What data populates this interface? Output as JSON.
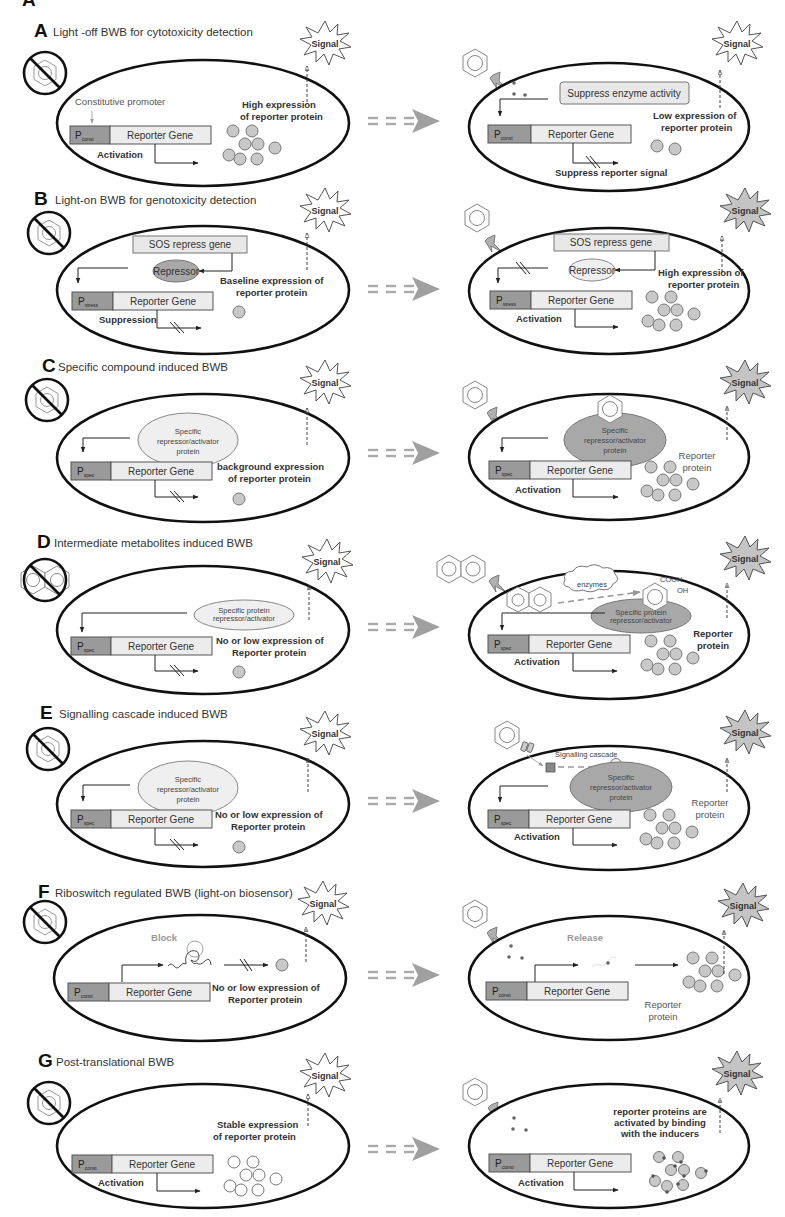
{
  "figure": {
    "transition_arrow_icon": "equals-arrow-right",
    "absent_compound_icon": "prohibited-benzene",
    "signal_label": "Signal",
    "reporter_gene_label": "Reporter Gene",
    "promoter_letter": "P"
  },
  "panels": [
    {
      "letter": "A",
      "title": "Light -off BWB for cytotoxicity detection",
      "promoter_sub": "const",
      "left": {
        "annotations": [
          "Constitutive promoter"
        ],
        "expression_label": [
          "High expression",
          "of reporter protein"
        ],
        "action_label": "Activation",
        "protein_count": 8,
        "signal_state": "off"
      },
      "right": {
        "box_label": "Suppress enzyme activity",
        "expression_label": [
          "Low expression of",
          "reporter protein"
        ],
        "action_label": "Suppress reporter signal",
        "protein_count": 2,
        "signal_state": "off"
      }
    },
    {
      "letter": "B",
      "title": "Light-on BWB for genotoxicity detection",
      "promoter_sub": "stress",
      "left": {
        "gene_box": "SOS repress gene",
        "repressor": "Repressor",
        "expression_label": [
          "Baseline expression of",
          "reporter protein"
        ],
        "action_label": "Suppression",
        "protein_count": 1,
        "signal_state": "off"
      },
      "right": {
        "gene_box": "SOS repress gene",
        "repressor": "Repressor",
        "expression_label": [
          "High expression of",
          "reporter protein"
        ],
        "action_label": "Activation",
        "protein_count": 8,
        "signal_state": "on"
      }
    },
    {
      "letter": "C",
      "title": "Specific compound induced BWB",
      "promoter_sub": "spec",
      "left": {
        "regulator": [
          "Specific",
          "repressor/activator",
          "protein"
        ],
        "expression_label": [
          "background expression",
          "of reporter protein"
        ],
        "protein_count": 1,
        "signal_state": "off"
      },
      "right": {
        "regulator": [
          "Specific",
          "repressor/activator",
          "protein"
        ],
        "expression_label": [
          "Reporter",
          "protein"
        ],
        "action_label": "Activation",
        "protein_count": 8,
        "signal_state": "on"
      }
    },
    {
      "letter": "D",
      "title": "Intermediate metabolites induced BWB",
      "promoter_sub": "spec",
      "left": {
        "regulator": [
          "Specific protein",
          "repressor/activator"
        ],
        "expression_label": [
          "No or low expression of",
          "Reporter protein"
        ],
        "protein_count": 1,
        "signal_state": "off"
      },
      "right": {
        "enzyme_label": "enzymes",
        "metabolite_groups": [
          "COOH",
          "OH"
        ],
        "regulator": [
          "Specific protein",
          "repressor/activator"
        ],
        "expression_label": [
          "Reporter",
          "protein"
        ],
        "action_label": "Activation",
        "protein_count": 8,
        "signal_state": "on"
      }
    },
    {
      "letter": "E",
      "title": "Signalling cascade induced BWB",
      "promoter_sub": "spec",
      "left": {
        "regulator": [
          "Specific",
          "repressor/activator",
          "protein"
        ],
        "expression_label": [
          "No or low expression of",
          "Reporter protein"
        ],
        "protein_count": 1,
        "signal_state": "off"
      },
      "right": {
        "cascade_label": "Signalling cascade",
        "regulator": [
          "Specific",
          "repressor/activator",
          "protein"
        ],
        "expression_label": [
          "Reporter",
          "protein"
        ],
        "action_label": "Activation",
        "protein_count": 8,
        "signal_state": "on"
      }
    },
    {
      "letter": "F",
      "title": "Riboswitch regulated BWB (light-on biosensor)",
      "promoter_sub": "const",
      "left": {
        "riboswitch_label": "Block",
        "expression_label": [
          "No or low expression of",
          "Reporter protein"
        ],
        "protein_count": 1,
        "signal_state": "off"
      },
      "right": {
        "riboswitch_label": "Release",
        "expression_label": [
          "Reporter",
          "protein"
        ],
        "protein_count": 8,
        "signal_state": "on"
      }
    },
    {
      "letter": "G",
      "title": "Post-translational BWB",
      "promoter_sub": "const",
      "left": {
        "expression_label": [
          "Stable expression",
          "of reporter protein"
        ],
        "action_label": "Activation",
        "protein_count": 8,
        "signal_state": "off"
      },
      "right": {
        "expression_label": [
          "reporter proteins are",
          "activated by binding",
          "with the inducers"
        ],
        "action_label": "Activation",
        "protein_count": 8,
        "signal_state": "on"
      }
    }
  ],
  "colors": {
    "signal_on_fill": "#c4c4c4",
    "signal_off_fill": "#ffffff",
    "promoter_fill": "#9a9a9a",
    "gene_fill": "#ececec",
    "protein_fill": "#c8c8c8",
    "arrow_grey": "#a0a0a0"
  }
}
